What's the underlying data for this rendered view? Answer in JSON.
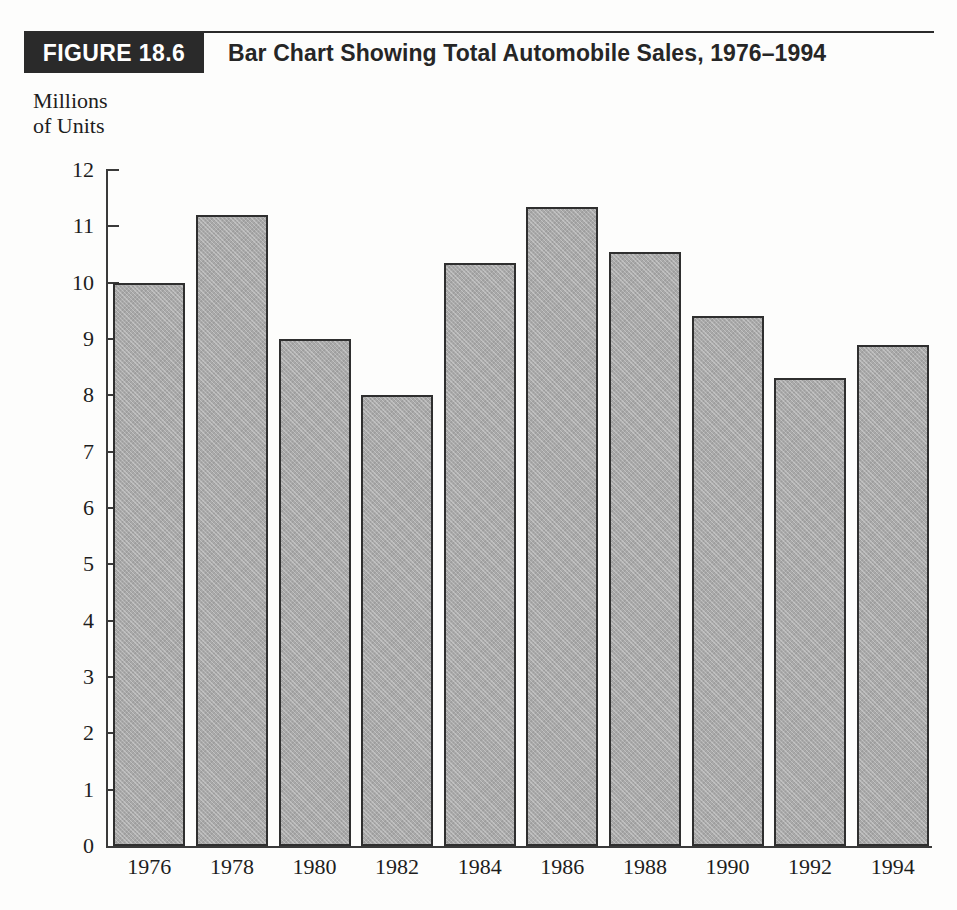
{
  "header": {
    "figure_tag": "FIGURE 18.6",
    "title": "Bar Chart Showing Total Automobile Sales, 1976–1994"
  },
  "axis_caption": "Millions\nof Units",
  "colors": {
    "bar_fill": "#a9a9a9",
    "bar_border": "#2f2f2f",
    "axis": "#3a3a3a",
    "tag_background": "#2a2a2a",
    "tag_text": "#ffffff",
    "text": "#1d1d1d",
    "page_background": "#fdfdfc"
  },
  "chart_data": {
    "type": "bar",
    "title": "Bar Chart Showing Total Automobile Sales, 1976–1994",
    "xlabel": "",
    "ylabel": "Millions of Units",
    "categories": [
      "1976",
      "1978",
      "1980",
      "1982",
      "1984",
      "1986",
      "1988",
      "1990",
      "1992",
      "1994"
    ],
    "values": [
      10.0,
      11.2,
      9.0,
      8.0,
      10.35,
      11.35,
      10.55,
      9.4,
      8.3,
      8.9
    ],
    "ylim": [
      0,
      12
    ],
    "ytick_step": 1,
    "yticks": [
      "12",
      "11",
      "10",
      "9",
      "8",
      "7",
      "6",
      "5",
      "4",
      "3",
      "2",
      "1",
      "0"
    ],
    "grid": false,
    "legend": false,
    "legend_position": "none"
  }
}
